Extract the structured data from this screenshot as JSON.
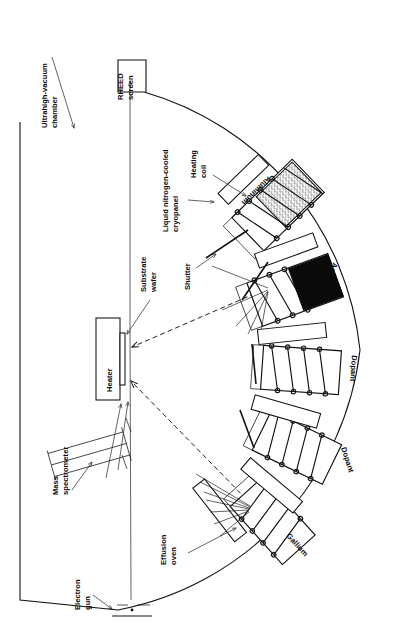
{
  "figure": {
    "title_hidden": "Molecular beam epitaxy (MBE) ultrahigh-vacuum growth chamber",
    "orientation": "rotated-90",
    "background_color": "#ffffff",
    "ink_color": "#111111"
  },
  "labels": {
    "chamber": "Ultrahigh-vacuum\nchamber",
    "chamber_line1": "Ultrahigh-vacuum",
    "chamber_line2": "chamber",
    "rheed_line1": "RHEED",
    "rheed_line2": "screen",
    "cryopanel_line1": "Liquid nitrogen-cooled",
    "cryopanel_line2": "cryopanel",
    "heating_coil_line1": "Heating",
    "heating_coil_line2": "coil",
    "aluminum": "Aluminum",
    "shutter": "Shutter",
    "arsenic": "Arsenic",
    "dopant_upper": "Dopant",
    "dopant_lower": "Dopant",
    "gallium": "Gallium",
    "effusion_line1": "Effusion",
    "effusion_line2": "oven",
    "substrate_line1": "Substrate",
    "substrate_line2": "wafer",
    "heater": "Heater",
    "mass_spec_line1": "Mass",
    "mass_spec_line2": "spectrometer",
    "electron_gun_line1": "Electron",
    "electron_gun_line2": "gun"
  },
  "sources": [
    {
      "name": "Aluminum",
      "fill": "gray-texture",
      "angle_deg": -44
    },
    {
      "name": "Arsenic",
      "fill": "black",
      "angle_deg": -20
    },
    {
      "name": "Dopant",
      "fill": "white",
      "angle_deg": 4
    },
    {
      "name": "Dopant",
      "fill": "white",
      "angle_deg": 26
    },
    {
      "name": "Gallium",
      "fill": "white",
      "angle_deg": 48
    }
  ],
  "colors": {
    "ink": "#111111",
    "paper": "#ffffff",
    "arsenic_fill": "#0a0a0a",
    "aluminum_fill": "#8e8e8e"
  }
}
